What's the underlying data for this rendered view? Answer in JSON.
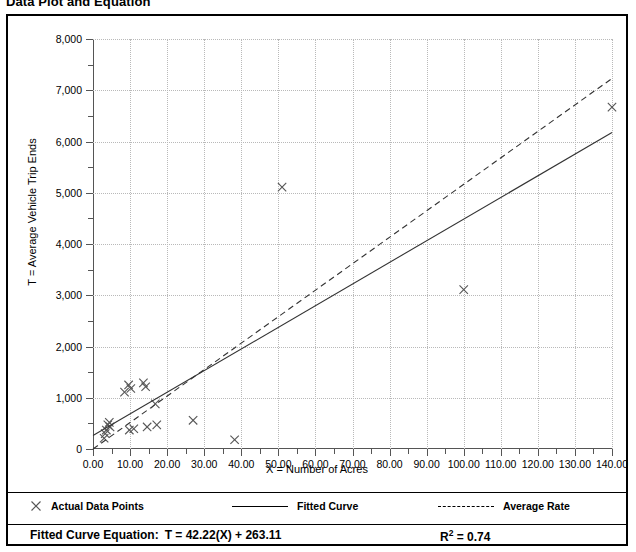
{
  "title": "Data Plot and Equation",
  "chart_data": {
    "type": "scatter",
    "title": "Data Plot and Equation",
    "xlabel": "X = Number of Acres",
    "ylabel": "T = Average Vehicle Trip Ends",
    "xlim": [
      0,
      140
    ],
    "ylim": [
      0,
      8000
    ],
    "xticks": [
      "0.00",
      "10.00",
      "20.00",
      "30.00",
      "40.00",
      "50.00",
      "60.00",
      "70.00",
      "80.00",
      "90.00",
      "100.00",
      "110.00",
      "120.00",
      "130.00",
      "140.00"
    ],
    "xtick_values": [
      0,
      10,
      20,
      30,
      40,
      50,
      60,
      70,
      80,
      90,
      100,
      110,
      120,
      130,
      140
    ],
    "yticks": [
      "0",
      "1,000",
      "2,000",
      "3,000",
      "4,000",
      "5,000",
      "6,000",
      "7,000",
      "8,000"
    ],
    "ytick_values": [
      0,
      1000,
      2000,
      3000,
      4000,
      5000,
      6000,
      7000,
      8000
    ],
    "grid": true,
    "grid_style": "dotted",
    "legend_position": "below-plot",
    "series": [
      {
        "name": "Actual Data Points",
        "type": "scatter",
        "marker": "x",
        "points": [
          [
            3.0,
            210
          ],
          [
            3.3,
            300
          ],
          [
            3.6,
            370
          ],
          [
            4.0,
            470
          ],
          [
            4.4,
            520
          ],
          [
            4.6,
            430
          ],
          [
            8.5,
            1110
          ],
          [
            9.6,
            1250
          ],
          [
            9.8,
            370
          ],
          [
            10.2,
            1180
          ],
          [
            11.0,
            395
          ],
          [
            13.6,
            1290
          ],
          [
            14.2,
            1215
          ],
          [
            14.6,
            430
          ],
          [
            16.8,
            880
          ],
          [
            17.2,
            470
          ],
          [
            27.0,
            560
          ],
          [
            38.2,
            180
          ],
          [
            51.0,
            5110
          ],
          [
            100.0,
            3110
          ],
          [
            140.0,
            6670
          ]
        ]
      },
      {
        "name": "Fitted Curve",
        "type": "line",
        "style": "solid",
        "equation": "T = 42.22(X) + 263.11",
        "slope": 42.22,
        "intercept": 263.11,
        "endpoints": [
          [
            0,
            263.11
          ],
          [
            140,
            6174.91
          ]
        ]
      },
      {
        "name": "Average Rate",
        "type": "line",
        "style": "dashed",
        "slope": 51.64,
        "intercept": 0,
        "endpoints": [
          [
            0,
            0
          ],
          [
            140,
            7230
          ]
        ]
      }
    ]
  },
  "legend": {
    "items": [
      {
        "label": "Actual Data Points",
        "marker": "x-marker"
      },
      {
        "label": "Fitted Curve",
        "marker": "solid-line"
      },
      {
        "label": "Average Rate",
        "marker": "dashed-line"
      }
    ]
  },
  "footer": {
    "equation_label": "Fitted Curve Equation:",
    "equation_value": "T = 42.22(X) + 263.11",
    "r2_prefix": "R",
    "r2_exponent": "2",
    "r2_value": "= 0.74"
  }
}
